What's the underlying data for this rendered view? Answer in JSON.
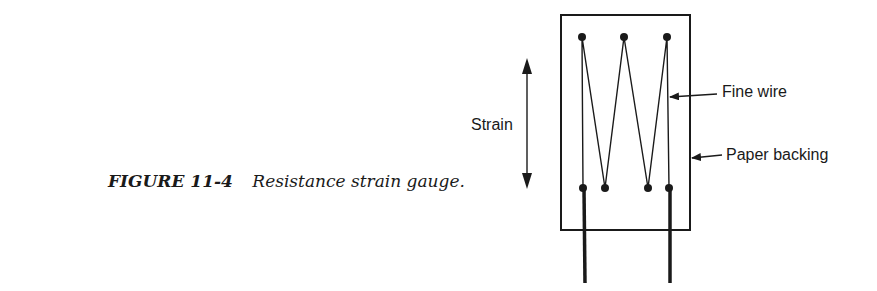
{
  "caption": {
    "figure_number": "FIGURE 11-4",
    "title": "Resistance strain gauge."
  },
  "diagram": {
    "labels": {
      "strain": "Strain",
      "fine_wire": "Fine wire",
      "paper_backing": "Paper backing"
    },
    "colors": {
      "ink": "#1a1a1a",
      "background": "#ffffff"
    }
  }
}
